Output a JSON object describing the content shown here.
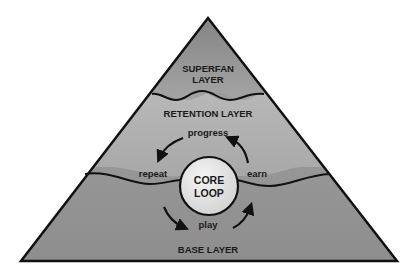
{
  "diagram": {
    "type": "pyramid",
    "layers": [
      {
        "id": "superfan",
        "line1": "SUPERFAN",
        "line2": "LAYER"
      },
      {
        "id": "retention",
        "label": "RETENTION LAYER"
      },
      {
        "id": "base",
        "label": "BASE LAYER"
      }
    ],
    "core": {
      "line1": "CORE",
      "line2": "LOOP"
    },
    "loop_steps": {
      "top": "progress",
      "left": "repeat",
      "right": "earn",
      "bottom": "play"
    },
    "colors": {
      "fill_top": "#8a8a8a",
      "fill_mid": "#b0b0b0",
      "fill_bottom": "#969696",
      "stroke": "#111111",
      "core_fill": "#e6e6e6"
    }
  }
}
